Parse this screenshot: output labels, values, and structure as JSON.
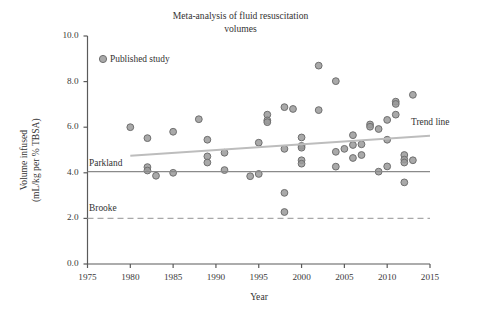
{
  "chart_data": {
    "type": "scatter",
    "title_line1": "Meta-analysis of fluid resuscitation",
    "title_line2": "volumes",
    "xlabel": "Year",
    "ylabel": "Volume infused\n(mL/kg per % TBSA)",
    "ylabel_line1": "Volume infused",
    "ylabel_line2": "(mL/kg per % TBSA)",
    "xlim": [
      1975,
      2015
    ],
    "ylim": [
      0.0,
      10.0
    ],
    "xticks": [
      1975,
      1980,
      1985,
      1990,
      1995,
      2000,
      2005,
      2010,
      2015
    ],
    "xtick_labels": [
      "1975",
      "1980",
      "1985",
      "1990",
      "1995",
      "2000",
      "2005",
      "2010",
      "2015"
    ],
    "yticks": [
      0.0,
      2.0,
      4.0,
      6.0,
      8.0,
      10.0
    ],
    "ytick_labels": [
      "0.0",
      "2.0",
      "4.0",
      "6.0",
      "8.0",
      "10.0"
    ],
    "grid": false,
    "legend_position": "upper-left-inside",
    "marker_color": "#9a9a9a",
    "marker_edge_color": "#6f6f6f",
    "trend_color": "#bdbdbd",
    "reference_color": "#8a8a8a",
    "series": [
      {
        "name": "Published study",
        "type": "scatter",
        "marker": "circle",
        "points": [
          {
            "x": 1980.0,
            "y": 6.0
          },
          {
            "x": 1982.0,
            "y": 5.52
          },
          {
            "x": 1982.0,
            "y": 4.25
          },
          {
            "x": 1982.0,
            "y": 4.1
          },
          {
            "x": 1983.0,
            "y": 3.87
          },
          {
            "x": 1985.0,
            "y": 5.8
          },
          {
            "x": 1985.0,
            "y": 4.0
          },
          {
            "x": 1988.0,
            "y": 6.35
          },
          {
            "x": 1989.0,
            "y": 5.45
          },
          {
            "x": 1989.0,
            "y": 4.72
          },
          {
            "x": 1989.0,
            "y": 4.45
          },
          {
            "x": 1991.0,
            "y": 4.88
          },
          {
            "x": 1991.0,
            "y": 4.12
          },
          {
            "x": 1994.0,
            "y": 3.85
          },
          {
            "x": 1995.0,
            "y": 5.32
          },
          {
            "x": 1995.0,
            "y": 3.95
          },
          {
            "x": 1996.0,
            "y": 6.55
          },
          {
            "x": 1996.0,
            "y": 6.3
          },
          {
            "x": 1996.0,
            "y": 6.22
          },
          {
            "x": 1998.0,
            "y": 6.88
          },
          {
            "x": 1998.0,
            "y": 5.05
          },
          {
            "x": 1998.0,
            "y": 3.12
          },
          {
            "x": 1998.0,
            "y": 2.28
          },
          {
            "x": 1999.0,
            "y": 6.8
          },
          {
            "x": 2000.0,
            "y": 5.55
          },
          {
            "x": 2000.0,
            "y": 5.18
          },
          {
            "x": 2000.0,
            "y": 5.1
          },
          {
            "x": 2000.0,
            "y": 4.55
          },
          {
            "x": 2000.0,
            "y": 4.4
          },
          {
            "x": 2002.0,
            "y": 8.7
          },
          {
            "x": 2002.0,
            "y": 6.75
          },
          {
            "x": 2004.0,
            "y": 8.02
          },
          {
            "x": 2004.0,
            "y": 4.92
          },
          {
            "x": 2004.0,
            "y": 4.27
          },
          {
            "x": 2005.0,
            "y": 5.05
          },
          {
            "x": 2006.0,
            "y": 5.65
          },
          {
            "x": 2006.0,
            "y": 5.22
          },
          {
            "x": 2006.0,
            "y": 4.65
          },
          {
            "x": 2007.0,
            "y": 5.25
          },
          {
            "x": 2007.0,
            "y": 4.78
          },
          {
            "x": 2008.0,
            "y": 6.12
          },
          {
            "x": 2008.0,
            "y": 6.02
          },
          {
            "x": 2009.0,
            "y": 5.92
          },
          {
            "x": 2009.0,
            "y": 4.05
          },
          {
            "x": 2010.0,
            "y": 6.32
          },
          {
            "x": 2010.0,
            "y": 5.45
          },
          {
            "x": 2010.0,
            "y": 4.28
          },
          {
            "x": 2011.0,
            "y": 7.12
          },
          {
            "x": 2011.0,
            "y": 7.02
          },
          {
            "x": 2011.0,
            "y": 6.55
          },
          {
            "x": 2012.0,
            "y": 4.78
          },
          {
            "x": 2012.0,
            "y": 4.58
          },
          {
            "x": 2012.0,
            "y": 4.45
          },
          {
            "x": 2012.0,
            "y": 3.58
          },
          {
            "x": 2013.0,
            "y": 7.42
          },
          {
            "x": 2013.0,
            "y": 4.55
          }
        ]
      },
      {
        "name": "Trend line",
        "type": "line",
        "style": "solid",
        "x": [
          1980,
          2015
        ],
        "y": [
          4.75,
          5.62
        ]
      },
      {
        "name": "Parkland",
        "type": "hline",
        "style": "solid",
        "y": 4.05,
        "x_start": 1975,
        "x_end": 2015
      },
      {
        "name": "Brooke",
        "type": "hline",
        "style": "dashed",
        "y": 2.0,
        "x_start": 1975,
        "x_end": 2015
      }
    ],
    "annotations": [
      {
        "name": "Parkland",
        "text": "Parkland",
        "x": 1975.2,
        "y": 4.45
      },
      {
        "name": "Brooke",
        "text": "Brooke",
        "x": 1975.2,
        "y": 2.45
      },
      {
        "name": "Trend line",
        "text": "Trend line",
        "x": 2013.0,
        "y": 6.05
      }
    ],
    "legend": [
      {
        "label": "Published study",
        "marker": "circle",
        "color": "#9a9a9a"
      }
    ]
  },
  "labels": {
    "legend_published_study": "Published study",
    "parkland": "Parkland",
    "brooke": "Brooke",
    "trend_line": "Trend line"
  }
}
